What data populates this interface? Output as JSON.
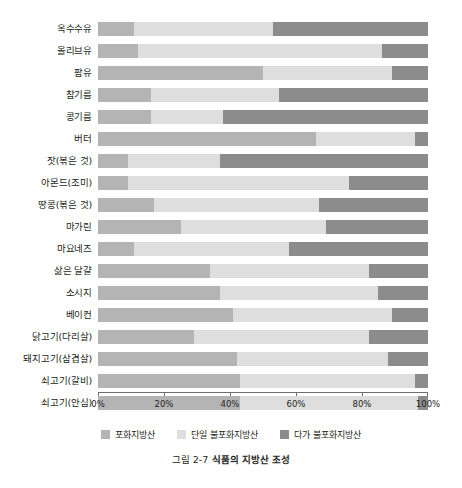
{
  "caption": {
    "prefix": "그림 2-7",
    "title": "식품의 지방산 조성",
    "full": "그림 2-7 식품의 지방산 조성"
  },
  "legend": {
    "position": "bottom-center",
    "items": [
      {
        "key": "sat",
        "label": "포화지방산",
        "color": "#b4b4b4"
      },
      {
        "key": "mono",
        "label": "단일 불포화지방산",
        "color": "#dedede"
      },
      {
        "key": "poly",
        "label": "다가 불포화지방산",
        "color": "#8c8c8c"
      }
    ]
  },
  "axis": {
    "ticks": [
      "0%",
      "20%",
      "40%",
      "60%",
      "80%",
      "100%"
    ],
    "min": 0,
    "max": 100
  },
  "chart_data": {
    "type": "bar",
    "orientation": "horizontal",
    "stacked": true,
    "stack_total": 100,
    "title": "그림 2-7 식품의 지방산 조성",
    "xlabel": "",
    "ylabel": "",
    "xlim": [
      0,
      100
    ],
    "xticks": [
      0,
      20,
      40,
      60,
      80,
      100
    ],
    "xtick_labels": [
      "0%",
      "20%",
      "40%",
      "60%",
      "80%",
      "100%"
    ],
    "grid": false,
    "legend_position": "bottom-center",
    "categories": [
      "옥수수유",
      "올리브유",
      "팜유",
      "참기름",
      "콩기름",
      "버터",
      "잣(볶은 것)",
      "아몬드(조미)",
      "땅콩(볶은 것)",
      "마가린",
      "마요네즈",
      "삶은 달걀",
      "소시지",
      "베이컨",
      "닭고기(다리살)",
      "돼지고기(삼겹살)",
      "쇠고기(갈비)",
      "쇠고기(안심)"
    ],
    "series": [
      {
        "name": "포화지방산",
        "color": "#b4b4b4",
        "values": [
          11,
          12,
          50,
          16,
          16,
          66,
          9,
          9,
          17,
          25,
          11,
          34,
          37,
          41,
          29,
          42,
          43,
          43
        ]
      },
      {
        "name": "단일 불포화지방산",
        "color": "#dedede",
        "values": [
          42,
          74,
          39,
          39,
          22,
          30,
          28,
          67,
          50,
          44,
          47,
          48,
          48,
          48,
          53,
          46,
          53,
          54
        ]
      },
      {
        "name": "다가 불포화지방산",
        "color": "#8c8c8c",
        "values": [
          47,
          14,
          11,
          45,
          62,
          4,
          63,
          24,
          33,
          31,
          42,
          18,
          15,
          11,
          18,
          12,
          4,
          3
        ]
      }
    ]
  }
}
